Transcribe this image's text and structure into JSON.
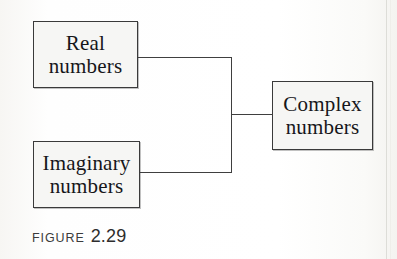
{
  "figure": {
    "caption_label": "FIGURE",
    "caption_number": "2.29",
    "diagram_type": "bracket-relationship-diagram",
    "colors": {
      "page_background": "#fdfdfc",
      "box_fill": "#f6f6f4",
      "box_border": "#3a3a3a",
      "connector": "#3f3f3f",
      "text": "#16161a",
      "caption_text": "#3b3b3b"
    },
    "nodes": [
      {
        "id": "real",
        "line1": "Real",
        "line2": "numbers",
        "position": "top-left"
      },
      {
        "id": "imaginary",
        "line1": "Imaginary",
        "line2": "numbers",
        "position": "bottom-left"
      },
      {
        "id": "complex",
        "line1": "Complex",
        "line2": "numbers",
        "position": "right"
      }
    ],
    "connections": [
      {
        "from": "real",
        "to": "complex"
      },
      {
        "from": "imaginary",
        "to": "complex"
      }
    ]
  }
}
